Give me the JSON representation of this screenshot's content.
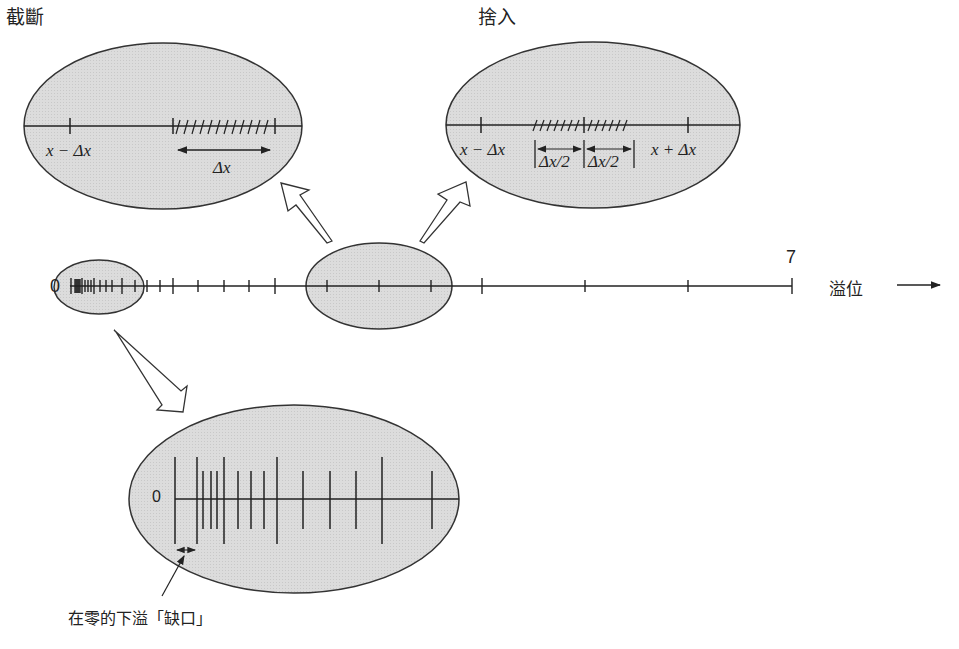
{
  "title_truncation": "截斷",
  "title_rounding": "捨入",
  "axis": {
    "zero_label": "0",
    "max_label": "7",
    "overflow_label": "溢位",
    "arrow": "→"
  },
  "truncation": {
    "left_label": "x − Δx",
    "interval_label": "Δx"
  },
  "rounding": {
    "left_label": "x − Δx",
    "half_left": "Δx/2",
    "half_right": "Δx/2",
    "right_label": "x + Δx"
  },
  "zoom_zero": {
    "zero_label": "0",
    "gap_caption": "在零的下溢「缺口」"
  },
  "colors": {
    "ellipse_fill": "#d9d9d9",
    "stroke": "#333333",
    "background": "#ffffff"
  }
}
